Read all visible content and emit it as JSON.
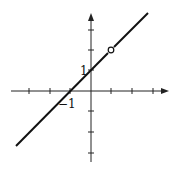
{
  "figure": {
    "function": "y = x + 1",
    "hole": {
      "x": 1,
      "y": 2
    },
    "labels": {
      "y_intercept": "1",
      "x_intercept": "−1"
    },
    "x_ticks": [
      -3,
      -2,
      -1,
      1,
      2,
      3
    ],
    "y_ticks": [
      -3,
      -2,
      -1,
      1,
      2,
      3
    ],
    "colors": {
      "line": "#111111",
      "axes": "#222222",
      "background": "#ffffff"
    }
  }
}
